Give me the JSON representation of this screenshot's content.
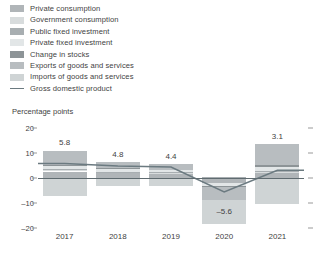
{
  "legend": {
    "items": [
      {
        "label": "Private consumption",
        "color": "#b0b5b8",
        "type": "swatch"
      },
      {
        "label": "Government consumption",
        "color": "#d8dcdd",
        "type": "swatch"
      },
      {
        "label": "Public fixed investment",
        "color": "#a8aeb1",
        "type": "swatch"
      },
      {
        "label": "Private fixed investment",
        "color": "#e2e6e7",
        "type": "swatch"
      },
      {
        "label": "Change in stocks",
        "color": "#8d9497",
        "type": "swatch"
      },
      {
        "label": "Exports of goods and services",
        "color": "#b8bdc0",
        "type": "swatch"
      },
      {
        "label": "Imports of goods and services",
        "color": "#cfd4d5",
        "type": "swatch"
      },
      {
        "label": "Gross domestic product",
        "color": "#6b7a80",
        "type": "line"
      }
    ]
  },
  "chart_data": {
    "type": "bar",
    "stacked": true,
    "title": "",
    "xlabel": "",
    "ylabel": "Percentage points",
    "ylim": [
      -20,
      20
    ],
    "yticks": [
      20,
      10,
      0,
      -10,
      -20
    ],
    "ytick_labels": [
      "20",
      "10",
      "0",
      "–10",
      "–20"
    ],
    "grid": false,
    "legend_position": "top-left",
    "categories": [
      "2017",
      "2018",
      "2019",
      "2020",
      "2021"
    ],
    "series": [
      {
        "name": "Private consumption",
        "color": "#b0b5b8",
        "values": [
          2.6,
          1.9,
          1.7,
          -1.8,
          2.2
        ]
      },
      {
        "name": "Government consumption",
        "color": "#d8dcdd",
        "values": [
          0.6,
          0.5,
          0.5,
          0.3,
          0.5
        ]
      },
      {
        "name": "Public fixed investment",
        "color": "#a8aeb1",
        "values": [
          0.3,
          0.2,
          0.2,
          0.1,
          0.2
        ]
      },
      {
        "name": "Private fixed investment",
        "color": "#e2e6e7",
        "values": [
          1.5,
          1.1,
          0.9,
          -1.3,
          1.4
        ]
      },
      {
        "name": "Change in stocks",
        "color": "#8d9497",
        "values": [
          0.4,
          0.3,
          -0.4,
          -0.5,
          1.0
        ]
      },
      {
        "name": "Exports of goods and services",
        "color": "#b8bdc0",
        "values": [
          5.6,
          2.5,
          2.2,
          -5.3,
          8.2
        ]
      },
      {
        "name": "Imports of goods and services",
        "color": "#cfd4d5",
        "values": [
          -7.0,
          -3.0,
          -2.6,
          -9.6,
          -10.5
        ]
      }
    ],
    "gdp_line": {
      "name": "Gross domestic product",
      "color": "#6b7a80",
      "values": [
        5.8,
        4.8,
        4.4,
        -5.6,
        3.1
      ]
    },
    "value_labels": [
      "5.8",
      "4.8",
      "4.4",
      "–5.6",
      "3.1"
    ],
    "bar_extents": [
      {
        "top": 11.1,
        "bottom": -7.0
      },
      {
        "top": 6.5,
        "bottom": -3.0
      },
      {
        "top": 5.5,
        "bottom": -3.0
      },
      {
        "top": 5.5,
        "bottom": -11.2
      },
      {
        "top": 13.5,
        "bottom": -10.5
      }
    ]
  }
}
